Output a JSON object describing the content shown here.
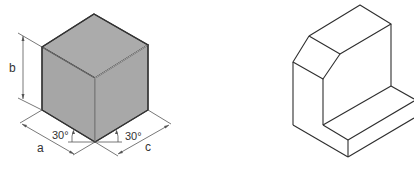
{
  "figure_left": {
    "title": "Isometric cube with dimension annotations",
    "labels": {
      "height": "b",
      "left_width": "a",
      "right_width": "c",
      "left_angle": "30°",
      "right_angle": "30°"
    },
    "colors": {
      "face_fill": "#a9a9a9",
      "edge": "#3a3a3a",
      "dim_line": "#555555"
    }
  },
  "figure_right": {
    "title": "Isometric drawing of L-shaped block with chamfered top",
    "colors": {
      "edge": "#2e2e2e"
    }
  }
}
